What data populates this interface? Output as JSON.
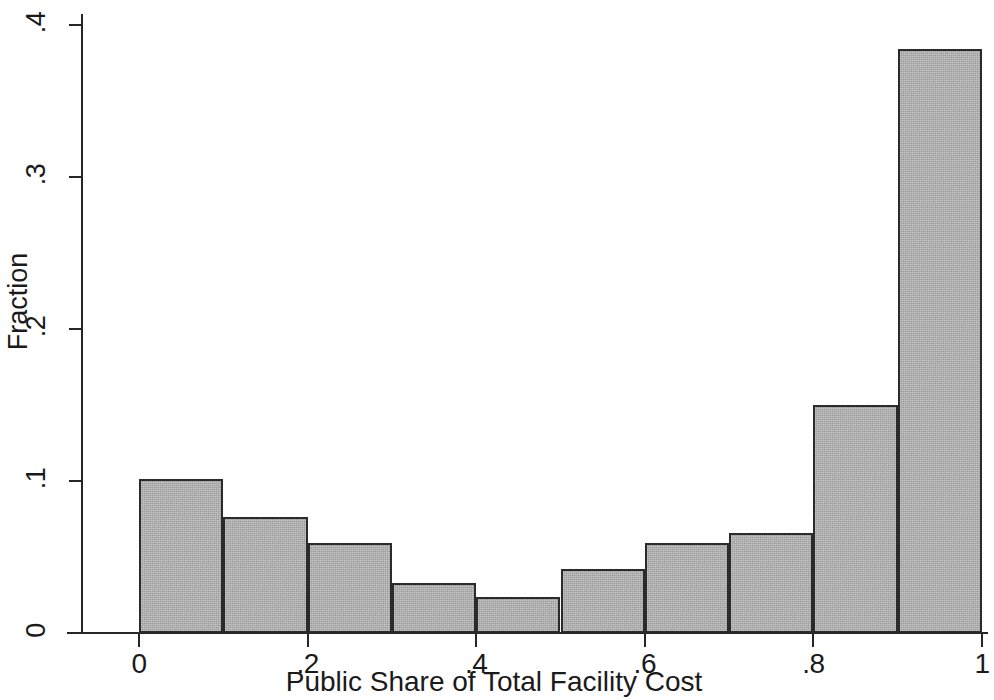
{
  "chart_data": {
    "type": "bar",
    "title": "",
    "subtitle": "",
    "xlabel": "Public Share of Total Facility Cost",
    "ylabel": "Fraction",
    "xlim": [
      0,
      1
    ],
    "ylim": [
      0,
      0.4
    ],
    "grid": false,
    "legend": null,
    "bin_width": 0.1,
    "bin_edges": [
      0,
      0.1,
      0.2,
      0.3,
      0.4,
      0.5,
      0.6,
      0.7,
      0.8,
      0.9,
      1.0
    ],
    "categories": [
      "0-.1",
      ".1-.2",
      ".2-.3",
      ".3-.4",
      ".4-.5",
      ".5-.6",
      ".6-.7",
      ".7-.8",
      ".8-.9",
      ".9-1"
    ],
    "values": [
      0.101,
      0.076,
      0.059,
      0.033,
      0.024,
      0.042,
      0.059,
      0.066,
      0.15,
      0.384
    ],
    "xticks": [
      {
        "value": 0,
        "label": "0"
      },
      {
        "value": 0.2,
        "label": ".2"
      },
      {
        "value": 0.4,
        "label": ".4"
      },
      {
        "value": 0.6,
        "label": ".6"
      },
      {
        "value": 0.8,
        "label": ".8"
      },
      {
        "value": 1.0,
        "label": "1"
      }
    ],
    "yticks": [
      {
        "value": 0,
        "label": "0"
      },
      {
        "value": 0.1,
        "label": ".1"
      },
      {
        "value": 0.2,
        "label": ".2"
      },
      {
        "value": 0.3,
        "label": ".3"
      },
      {
        "value": 0.4,
        "label": ".4"
      }
    ],
    "colors": {
      "bar_fill": "#b0b0b0",
      "bar_edge": "#2b2b2b",
      "axis": "#262626",
      "text": "#1a1a1a",
      "background": "#ffffff"
    }
  }
}
